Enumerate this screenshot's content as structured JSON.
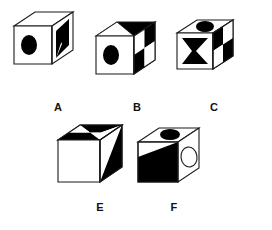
{
  "figure": {
    "background_color": "#ffffff",
    "ink_color": "#000000",
    "stroke_color": "#1a1a1a",
    "labels": [
      "A",
      "B",
      "C",
      "E",
      "F"
    ],
    "cubes": [
      {
        "id": "cube-a",
        "label": "A",
        "label_x": 50,
        "label_y": 102,
        "origin_x": 14,
        "origin_y": 12,
        "size": 38,
        "depth_x": 21,
        "depth_y": 14,
        "top_face": {
          "pattern": "plain-white"
        },
        "left_face": {
          "pattern": "ellipse-black"
        },
        "right_face": {
          "pattern": "bowtie-black"
        }
      },
      {
        "id": "cube-b",
        "label": "B",
        "label_x": 129,
        "label_y": 102,
        "origin_x": 96,
        "origin_y": 22,
        "size": 38,
        "depth_x": 21,
        "depth_y": 14,
        "top_face": {
          "pattern": "black-with-white-triangle"
        },
        "left_face": {
          "pattern": "ellipse-black"
        },
        "right_face": {
          "pattern": "checkerboard"
        }
      },
      {
        "id": "cube-c",
        "label": "C",
        "label_x": 206,
        "label_y": 102,
        "origin_x": 177,
        "origin_y": 20,
        "size": 36,
        "depth_x": 20,
        "depth_y": 13,
        "top_face": {
          "pattern": "ellipse-black"
        },
        "left_face": {
          "pattern": "bowtie-black"
        },
        "right_face": {
          "pattern": "checkerboard"
        }
      },
      {
        "id": "cube-e",
        "label": "E",
        "label_x": 92,
        "label_y": 202,
        "origin_x": 58,
        "origin_y": 125,
        "size": 42,
        "depth_x": 22,
        "depth_y": 15,
        "top_face": {
          "pattern": "checkerboard"
        },
        "left_face": {
          "pattern": "plain-white"
        },
        "right_face": {
          "pattern": "triangle-black"
        }
      },
      {
        "id": "cube-f",
        "label": "F",
        "label_x": 166,
        "label_y": 202,
        "origin_x": 138,
        "origin_y": 128,
        "size": 40,
        "depth_x": 21,
        "depth_y": 14,
        "top_face": {
          "pattern": "ellipse-black"
        },
        "left_face": {
          "pattern": "triangle-black-lower"
        },
        "right_face": {
          "pattern": "ellipse-outline"
        }
      }
    ]
  }
}
